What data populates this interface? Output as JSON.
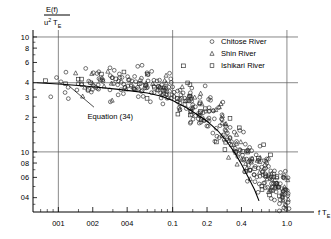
{
  "chart_data": {
    "type": "scatter",
    "title": "",
    "xlabel": "f T_E",
    "ylabel": "E(f) / (u*^2 T_E)",
    "xscale": "log",
    "yscale": "log",
    "xlim": [
      0.006,
      1.25
    ],
    "ylim": [
      0.3,
      11.5
    ],
    "grid": true,
    "gridlines_x": [
      0.01,
      0.1,
      1.0
    ],
    "gridlines_y": [
      10,
      4,
      1.0
    ],
    "xticks": [
      0.01,
      0.02,
      0.04,
      0.1,
      0.2,
      0.4,
      1.0
    ],
    "xtick_labels": [
      "001",
      "002",
      "004",
      "0.1",
      "0.2",
      "0.4",
      "1.0"
    ],
    "yticks": [
      10,
      8,
      6,
      4,
      3,
      2,
      1.0,
      0.8,
      0.6,
      0.4
    ],
    "ytick_labels": [
      "10",
      "8",
      "6",
      "4",
      "3",
      "2",
      "10",
      "08",
      "06",
      "04"
    ],
    "legend_position": "top-right",
    "series": [
      {
        "name": "Chitose River",
        "marker": "circle",
        "count": 300
      },
      {
        "name": "Shin River",
        "marker": "triangle",
        "count": 70
      },
      {
        "name": "Ishikari River",
        "marker": "square",
        "count": 60
      }
    ],
    "annotations": [
      {
        "text": "Equation (34)",
        "x": 0.018,
        "y": 1.95,
        "leader_from": [
          0.0205,
          2.45
        ],
        "leader_to": [
          0.0125,
          3.72
        ]
      }
    ],
    "equation_curve": {
      "label": "Equation (34)",
      "points": [
        [
          0.0065,
          4.0
        ],
        [
          0.01,
          3.9
        ],
        [
          0.015,
          3.78
        ],
        [
          0.022,
          3.65
        ],
        [
          0.032,
          3.52
        ],
        [
          0.045,
          3.38
        ],
        [
          0.06,
          3.25
        ],
        [
          0.08,
          3.05
        ],
        [
          0.1,
          2.8
        ],
        [
          0.13,
          2.45
        ],
        [
          0.16,
          2.15
        ],
        [
          0.2,
          1.85
        ],
        [
          0.25,
          1.52
        ],
        [
          0.3,
          1.22
        ],
        [
          0.35,
          0.98
        ],
        [
          0.4,
          0.78
        ],
        [
          0.46,
          0.6
        ],
        [
          0.52,
          0.47
        ],
        [
          0.57,
          0.375
        ]
      ]
    },
    "scatter_band": {
      "note": "dense cloud following flat-then-rolloff trend",
      "control_points": [
        [
          0.008,
          4.2
        ],
        [
          0.012,
          4.1
        ],
        [
          0.02,
          4.0
        ],
        [
          0.035,
          3.9
        ],
        [
          0.06,
          3.8
        ],
        [
          0.1,
          3.4
        ],
        [
          0.15,
          2.6
        ],
        [
          0.22,
          2.0
        ],
        [
          0.32,
          1.35
        ],
        [
          0.45,
          0.88
        ],
        [
          0.65,
          0.62
        ],
        [
          0.95,
          0.45
        ]
      ],
      "spread_decades": 0.155
    }
  },
  "legend": {
    "items": [
      {
        "label": "Chitose River",
        "marker": "circle"
      },
      {
        "label": "Shin River",
        "marker": "triangle"
      },
      {
        "label": "Ishikari River",
        "marker": "square"
      }
    ]
  },
  "ylabel_parts": {
    "numerator": "E(f)",
    "denom_base": "u",
    "denom_sup": "2",
    "denom_t": "T",
    "denom_sub": "E"
  },
  "xlabel_parts": {
    "f": "f T",
    "sub": "E"
  },
  "colors": {
    "axis": "#000000",
    "grid": "#555555",
    "marker": "#2a2a2a",
    "background": "#ffffff"
  }
}
